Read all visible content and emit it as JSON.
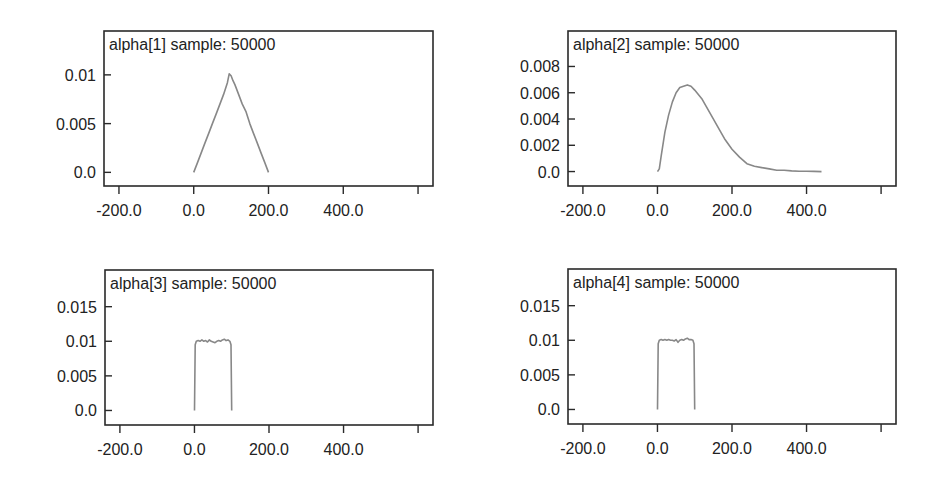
{
  "figure": {
    "background": "#ffffff",
    "axis_color": "#2a2a2a",
    "line_color": "#888888"
  },
  "chart_data": [
    {
      "type": "line",
      "title": "alpha[1] sample: 50000",
      "xlabel": "",
      "ylabel": "",
      "xlim": [
        -240,
        640
      ],
      "ylim": [
        -0.0014,
        0.0145
      ],
      "xticks": [
        -200,
        0,
        200,
        400,
        600
      ],
      "xtick_labels": [
        "-200.0",
        "0.0",
        "200.0",
        "400.0",
        ""
      ],
      "yticks": [
        0.0,
        0.005,
        0.01
      ],
      "ytick_labels": [
        "0.0",
        "0.005",
        "0.01"
      ],
      "grid": false,
      "legend": null,
      "box": {
        "x0": 104,
        "y0": 31,
        "x1": 433,
        "y1": 186
      },
      "x": [
        0,
        10,
        20,
        30,
        40,
        50,
        60,
        70,
        80,
        90,
        95,
        100,
        105,
        110,
        120,
        130,
        140,
        150,
        160,
        170,
        180,
        190,
        200
      ],
      "y": [
        0.0,
        0.001,
        0.002,
        0.003,
        0.004,
        0.005,
        0.006,
        0.007,
        0.008,
        0.0092,
        0.0101,
        0.0099,
        0.0094,
        0.009,
        0.008,
        0.007,
        0.0062,
        0.005,
        0.004,
        0.003,
        0.002,
        0.001,
        0.0
      ]
    },
    {
      "type": "line",
      "title": "alpha[2] sample: 50000",
      "xlabel": "",
      "ylabel": "",
      "xlim": [
        -240,
        640
      ],
      "ylim": [
        -0.0011,
        0.0107
      ],
      "xticks": [
        -200,
        0,
        200,
        400,
        600
      ],
      "xtick_labels": [
        "-200.0",
        "0.0",
        "200.0",
        "400.0",
        ""
      ],
      "yticks": [
        0.0,
        0.002,
        0.004,
        0.006,
        0.008
      ],
      "ytick_labels": [
        "0.0",
        "0.002",
        "0.004",
        "0.006",
        "0.008"
      ],
      "grid": false,
      "legend": null,
      "box": {
        "x0": 568,
        "y0": 31,
        "x1": 896,
        "y1": 186
      },
      "x": [
        0,
        5,
        10,
        20,
        30,
        40,
        50,
        60,
        70,
        80,
        90,
        100,
        120,
        140,
        160,
        180,
        200,
        220,
        240,
        260,
        280,
        300,
        320,
        340,
        360,
        380,
        400,
        420,
        440
      ],
      "y": [
        0.0,
        0.0002,
        0.0012,
        0.003,
        0.0043,
        0.0053,
        0.006,
        0.0064,
        0.0065,
        0.0066,
        0.0065,
        0.0062,
        0.0055,
        0.0045,
        0.0035,
        0.0025,
        0.0017,
        0.0011,
        0.0006,
        0.0004,
        0.0003,
        0.0002,
        0.0001,
        0.0001,
        5e-05,
        3e-05,
        2e-05,
        1e-05,
        0.0
      ]
    },
    {
      "type": "line",
      "title": "alpha[3] sample: 50000",
      "xlabel": "",
      "ylabel": "",
      "xlim": [
        -240,
        640
      ],
      "ylim": [
        -0.0021,
        0.0203
      ],
      "xticks": [
        -200,
        0,
        200,
        400,
        600
      ],
      "xtick_labels": [
        "-200.0",
        "0.0",
        "200.0",
        "400.0",
        ""
      ],
      "yticks": [
        0.0,
        0.005,
        0.01,
        0.015
      ],
      "ytick_labels": [
        "0.0",
        "0.005",
        "0.01",
        "0.015"
      ],
      "grid": false,
      "legend": null,
      "box": {
        "x0": 105,
        "y0": 270,
        "x1": 433,
        "y1": 425
      },
      "x": [
        0,
        2,
        5,
        10,
        15,
        20,
        25,
        30,
        35,
        40,
        45,
        50,
        55,
        60,
        65,
        70,
        75,
        80,
        85,
        90,
        95,
        98,
        100
      ],
      "y": [
        0.0,
        0.0095,
        0.01,
        0.0101,
        0.01,
        0.0102,
        0.01,
        0.0101,
        0.0099,
        0.0102,
        0.01,
        0.0099,
        0.0098,
        0.01,
        0.0101,
        0.01,
        0.0102,
        0.0103,
        0.0101,
        0.0102,
        0.01,
        0.0095,
        0.0
      ]
    },
    {
      "type": "line",
      "title": "alpha[4] sample: 50000",
      "xlabel": "",
      "ylabel": "",
      "xlim": [
        -240,
        640
      ],
      "ylim": [
        -0.0021,
        0.0203
      ],
      "xticks": [
        -200,
        0,
        200,
        400,
        600
      ],
      "xtick_labels": [
        "-200.0",
        "0.0",
        "200.0",
        "400.0",
        ""
      ],
      "yticks": [
        0.0,
        0.005,
        0.01,
        0.015
      ],
      "ytick_labels": [
        "0.0",
        "0.005",
        "0.01",
        "0.015"
      ],
      "grid": false,
      "legend": null,
      "box": {
        "x0": 568,
        "y0": 269,
        "x1": 896,
        "y1": 424
      },
      "x": [
        0,
        2,
        5,
        10,
        15,
        20,
        25,
        30,
        35,
        40,
        45,
        50,
        55,
        60,
        65,
        70,
        75,
        80,
        85,
        90,
        95,
        98,
        100
      ],
      "y": [
        0.0,
        0.0095,
        0.01,
        0.0101,
        0.01,
        0.0101,
        0.01,
        0.0101,
        0.01,
        0.01,
        0.0099,
        0.0101,
        0.0097,
        0.01,
        0.0101,
        0.01,
        0.0102,
        0.0103,
        0.0101,
        0.0101,
        0.01,
        0.0095,
        0.0
      ]
    }
  ]
}
